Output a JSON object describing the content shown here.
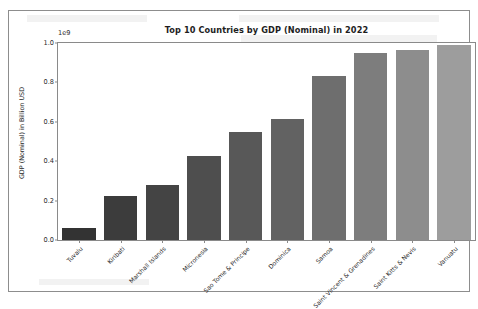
{
  "chart_data": {
    "type": "bar",
    "title": "Top 10 Countries by GDP (Nominal) in 2022",
    "xlabel": "",
    "ylabel": "GDP (Nominal) in Billion USD",
    "y_offset_text": "1e9",
    "ylim": [
      0,
      1.0
    ],
    "yticks": [
      "0.0",
      "0.2",
      "0.4",
      "0.6",
      "0.8",
      "1.0"
    ],
    "ytick_values": [
      0.0,
      0.2,
      0.4,
      0.6,
      0.8,
      1.0
    ],
    "grid": false,
    "legend": "none",
    "categories": [
      "Tuvalu",
      "Kiribati",
      "Marshall Islands",
      "Micronesia",
      "Sao Tome & Principe",
      "Dominica",
      "Samoa",
      "Saint Vincent & Grenadines",
      "Saint Kitts & Nevis",
      "Vanuatu"
    ],
    "values": [
      0.06,
      0.222,
      0.281,
      0.428,
      0.549,
      0.615,
      0.835,
      0.951,
      0.965,
      0.99
    ],
    "value_unit": "1e9 USD",
    "bar_colors": [
      "#333333",
      "#3c3c3c",
      "#444444",
      "#4e4e4e",
      "#585858",
      "#626262",
      "#6e6e6e",
      "#7d7d7d",
      "#8d8d8d",
      "#9d9d9d"
    ]
  },
  "colors": {
    "axis": "#8a8a8a",
    "text": "#222222",
    "background": "#ffffff",
    "frame": "#8d8d8d"
  }
}
